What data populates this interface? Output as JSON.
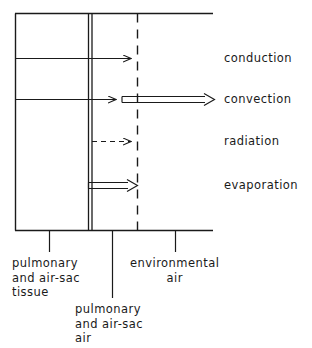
{
  "figure": {
    "type": "schematic-diagram",
    "stroke_color": "#1a1a1a",
    "background_color": "#ffffff"
  },
  "flow_labels": [
    {
      "id": "conduction",
      "text": "conduction",
      "arrow_style": "single-line",
      "dashed": false
    },
    {
      "id": "convection",
      "text": "convection",
      "arrow_style": "single-then-double-line",
      "dashed": false
    },
    {
      "id": "radiation",
      "text": "radiation",
      "arrow_style": "dashed-line",
      "dashed": true
    },
    {
      "id": "evaporation",
      "text": "evaporation",
      "arrow_style": "double-line",
      "dashed": false
    }
  ],
  "region_labels": [
    {
      "id": "tissue",
      "text": "pulmonary\nand air-sac\ntissue"
    },
    {
      "id": "air-sac-air",
      "text": "pulmonary\nand air-sac\nair"
    },
    {
      "id": "environment",
      "text": "environmental\nair"
    }
  ]
}
